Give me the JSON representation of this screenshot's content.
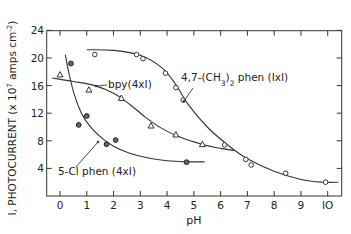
{
  "chart_data": {
    "type": "scatter",
    "title": "",
    "xlabel": "pH",
    "ylabel": "I, PHOTOCURRENT (x 10^7 amps cm^-2)",
    "ylabel_parts": {
      "main": "I, PHOTOCURRENT (x 10",
      "exp1": "7",
      "mid": " amps cm",
      "exp2": "-2",
      "end": ")"
    },
    "xlim": [
      -0.5,
      10.5
    ],
    "ylim": [
      0,
      24
    ],
    "xticks": [
      0,
      1,
      2,
      3,
      4,
      5,
      6,
      7,
      8,
      9,
      10
    ],
    "yticks": [
      4,
      8,
      12,
      16,
      20,
      24
    ],
    "grid": false,
    "legend": "inline annotations",
    "series": [
      {
        "name": "4,7-(CH3)2 phen (1xI)",
        "label_parts": {
          "a": "4,7-(CH",
          "sub1": "3",
          "b": ")",
          "sub2": "2",
          "c": " phen (IxI)"
        },
        "marker": "open-circle",
        "x": [
          1.3,
          2.86,
          3.1,
          3.94,
          4.33,
          4.6,
          6.15,
          6.94,
          7.14,
          8.43,
          9.92
        ],
        "y": [
          20.5,
          20.5,
          19.9,
          17.8,
          15.7,
          13.9,
          7.4,
          5.3,
          4.5,
          3.3,
          2.0
        ],
        "curve": [
          [
            1.0,
            21.2
          ],
          [
            2.0,
            21.1
          ],
          [
            3.0,
            20.4
          ],
          [
            3.8,
            18.6
          ],
          [
            4.3,
            16.3
          ],
          [
            4.8,
            13.2
          ],
          [
            5.5,
            10.0
          ],
          [
            6.3,
            7.3
          ],
          [
            7.0,
            5.4
          ],
          [
            8.0,
            3.6
          ],
          [
            9.0,
            2.4
          ],
          [
            9.8,
            2.0
          ],
          [
            10.4,
            2.0
          ]
        ]
      },
      {
        "name": "bpy (4xI)",
        "label": "bpy(4xI)",
        "marker": "open-triangle",
        "x": [
          0.0,
          1.08,
          2.29,
          3.4,
          4.33,
          5.32
        ],
        "y": [
          17.6,
          15.4,
          14.2,
          10.2,
          8.9,
          7.5
        ],
        "curve": [
          [
            -0.3,
            17.1
          ],
          [
            0.5,
            16.6
          ],
          [
            1.3,
            16.0
          ],
          [
            2.0,
            14.9
          ],
          [
            2.6,
            13.3
          ],
          [
            3.2,
            11.4
          ],
          [
            3.8,
            9.8
          ],
          [
            4.5,
            8.5
          ],
          [
            5.3,
            7.5
          ],
          [
            6.0,
            6.9
          ],
          [
            6.5,
            6.6
          ]
        ]
      },
      {
        "name": "5-Cl phen (4xI)",
        "label": "5-Cl phen (4xI)",
        "marker": "filled-circle",
        "x": [
          0.41,
          0.7,
          1.0,
          1.74,
          2.08,
          4.73
        ],
        "y": [
          19.2,
          10.3,
          11.6,
          7.5,
          8.1,
          4.9
        ],
        "curve": [
          [
            0.2,
            20.5
          ],
          [
            0.35,
            17.5
          ],
          [
            0.55,
            14.5
          ],
          [
            0.8,
            12.0
          ],
          [
            1.1,
            10.2
          ],
          [
            1.5,
            8.6
          ],
          [
            2.0,
            7.2
          ],
          [
            2.6,
            6.2
          ],
          [
            3.3,
            5.5
          ],
          [
            4.0,
            5.1
          ],
          [
            4.7,
            4.95
          ],
          [
            5.4,
            4.95
          ]
        ]
      }
    ]
  },
  "axes": {
    "x_tick_labels": [
      "0",
      "1",
      "2",
      "3",
      "4",
      "5",
      "6",
      "7",
      "8",
      "9",
      "IO"
    ],
    "y_tick_labels": [
      "4",
      "8",
      "12",
      "16",
      "20",
      "24"
    ]
  }
}
